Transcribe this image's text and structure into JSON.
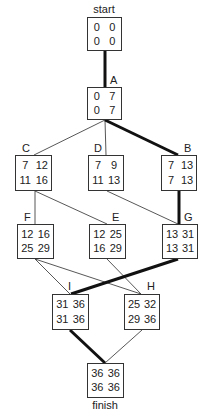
{
  "diagram": {
    "type": "activity-on-node network (critical path)",
    "colors": {
      "box_border": "#333333",
      "text": "#222222",
      "edge": "#444444",
      "critical_edge": "#111111"
    },
    "nodes": {
      "start": {
        "label": "start",
        "es": "0",
        "ef": "0",
        "ls": "0",
        "lf": "0"
      },
      "A": {
        "label": "A",
        "es": "0",
        "ef": "7",
        "ls": "0",
        "lf": "7"
      },
      "C": {
        "label": "C",
        "es": "7",
        "ef": "12",
        "ls": "11",
        "lf": "16"
      },
      "D": {
        "label": "D",
        "es": "7",
        "ef": "9",
        "ls": "11",
        "lf": "13"
      },
      "B": {
        "label": "B",
        "es": "7",
        "ef": "13",
        "ls": "7",
        "lf": "13"
      },
      "F": {
        "label": "F",
        "es": "12",
        "ef": "16",
        "ls": "25",
        "lf": "29"
      },
      "E": {
        "label": "E",
        "es": "12",
        "ef": "25",
        "ls": "16",
        "lf": "29"
      },
      "G": {
        "label": "G",
        "es": "13",
        "ef": "31",
        "ls": "13",
        "lf": "31"
      },
      "I": {
        "label": "I",
        "es": "31",
        "ef": "36",
        "ls": "31",
        "lf": "36"
      },
      "H": {
        "label": "H",
        "es": "25",
        "ef": "32",
        "ls": "29",
        "lf": "36"
      },
      "finish": {
        "label": "finish",
        "es": "36",
        "ef": "36",
        "ls": "36",
        "lf": "36"
      }
    },
    "edges": [
      {
        "from": "start",
        "to": "A",
        "critical": true
      },
      {
        "from": "A",
        "to": "C",
        "critical": false
      },
      {
        "from": "A",
        "to": "D",
        "critical": false
      },
      {
        "from": "A",
        "to": "B",
        "critical": true
      },
      {
        "from": "C",
        "to": "F",
        "critical": false
      },
      {
        "from": "C",
        "to": "E",
        "critical": false
      },
      {
        "from": "D",
        "to": "G",
        "critical": false
      },
      {
        "from": "B",
        "to": "G",
        "critical": true
      },
      {
        "from": "F",
        "to": "I",
        "critical": false
      },
      {
        "from": "F",
        "to": "H",
        "critical": false
      },
      {
        "from": "E",
        "to": "H",
        "critical": false
      },
      {
        "from": "G",
        "to": "I",
        "critical": true
      },
      {
        "from": "I",
        "to": "finish",
        "critical": true
      },
      {
        "from": "H",
        "to": "finish",
        "critical": false
      }
    ],
    "critical_path": [
      "start",
      "A",
      "B",
      "G",
      "I",
      "finish"
    ]
  }
}
